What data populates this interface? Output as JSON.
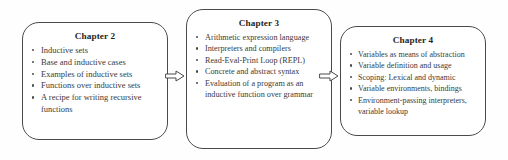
{
  "diagram": {
    "type": "flow",
    "direction": "left-to-right",
    "accent_color": "#4a4a4a",
    "text_color": "#3a3a3a",
    "background": "#ffffff",
    "boxes": [
      {
        "id": "chapter-2",
        "title": "Chapter 2",
        "items": [
          "Inductive sets",
          "Base and inductive cases",
          "Examples of inductive sets",
          "Functions over inductive sets",
          "A recipe for writing recursive functions"
        ]
      },
      {
        "id": "chapter-3",
        "title": "Chapter 3",
        "items": [
          "Arithmetic expression language",
          "Interpreters and compilers",
          "Read-Eval-Print Loop (REPL)",
          "Concrete and abstract syntax",
          "Evaluation of a program as an inductive function over grammar"
        ]
      },
      {
        "id": "chapter-4",
        "title": "Chapter 4",
        "items": [
          "Variables as means of abstraction",
          "Variable definition and usage",
          "Scoping: Lexical and dynamic",
          "Variable environments, bindings",
          "Environment-passing interpreters, variable lookup"
        ]
      }
    ],
    "connectors": [
      {
        "id": "arrow-chapter2-to-chapter3",
        "icon": "arrow-right-icon",
        "from": "chapter-2",
        "to": "chapter-3"
      },
      {
        "id": "arrow-chapter3-to-chapter4",
        "icon": "arrow-right-icon",
        "from": "chapter-3",
        "to": "chapter-4"
      }
    ]
  }
}
